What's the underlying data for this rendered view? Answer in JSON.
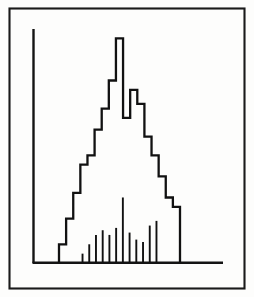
{
  "figure": {
    "title": "",
    "background_color": "#fdfdfc",
    "ink_color": "#111111",
    "frame": {
      "label": "outer-border",
      "x": 9,
      "y": 8,
      "width": 236,
      "height": 281,
      "stroke_width": 2.1
    },
    "axes": {
      "y_axis": {
        "x": 33,
        "y_top": 29,
        "y_bottom": 263
      },
      "x_axis": {
        "y": 263,
        "x_left": 33,
        "x_right": 223
      },
      "ticks_visible": false,
      "tick_labels_visible": false,
      "axis_titles_visible": false
    }
  },
  "chart_data": {
    "type": "bar",
    "title": "",
    "subtitle": "",
    "xlabel": "",
    "ylabel": "",
    "grid": false,
    "legend": false,
    "legend_position": "none",
    "render_style": "step-outline-histogram-with-impulse-spikes",
    "xlim": [
      0,
      18
    ],
    "ylim": [
      0,
      100
    ],
    "categories": [
      "1",
      "2",
      "3",
      "4",
      "5",
      "6",
      "7",
      "8",
      "9",
      "10",
      "11",
      "12",
      "13",
      "14",
      "15",
      "16",
      "17"
    ],
    "series": [
      {
        "name": "histogram",
        "kind": "step",
        "values": [
          8,
          19,
          30,
          42,
          46,
          57,
          66,
          78,
          96,
          62,
          74,
          68,
          54,
          46,
          37,
          28,
          24
        ]
      },
      {
        "name": "spikes",
        "kind": "impulse",
        "x": [
          3,
          4,
          5,
          6,
          7,
          8,
          9,
          10,
          11,
          12,
          13,
          14
        ],
        "values": [
          4,
          8,
          12,
          14,
          12,
          15,
          28,
          13,
          10,
          9,
          16,
          18
        ]
      }
    ]
  }
}
